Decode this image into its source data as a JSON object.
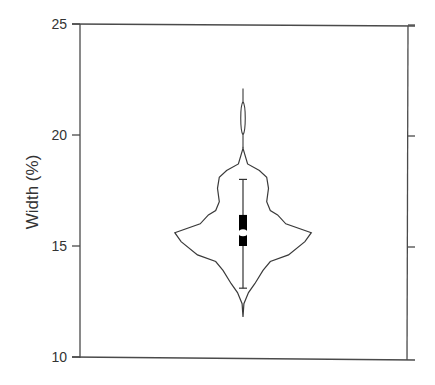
{
  "chart_data": {
    "type": "violin",
    "title": "",
    "xlabel": "",
    "ylabel": "Width (%)",
    "ylim": [
      10,
      25
    ],
    "yticks": [
      10,
      15,
      20,
      25
    ],
    "ytick_labels": [
      "10",
      "15",
      "20",
      "25"
    ],
    "right_axis_ticks": [
      15,
      20,
      25
    ],
    "grid": false,
    "legend": null,
    "series": [
      {
        "name": "Width",
        "box": {
          "whisker_low": 13.1,
          "q1": 15.0,
          "median": 15.6,
          "q3": 16.4,
          "whisker_high": 18.0
        },
        "violin_range": [
          11.8,
          22.1
        ],
        "density_profile": [
          {
            "y": 22.1,
            "half_width": 0.0
          },
          {
            "y": 21.4,
            "half_width": 0.01
          },
          {
            "y": 20.8,
            "half_width": 0.03
          },
          {
            "y": 20.2,
            "half_width": 0.01
          },
          {
            "y": 19.4,
            "half_width": 0.0
          },
          {
            "y": 18.7,
            "half_width": 0.05
          },
          {
            "y": 18.4,
            "half_width": 0.18
          },
          {
            "y": 18.1,
            "half_width": 0.26
          },
          {
            "y": 17.6,
            "half_width": 0.28
          },
          {
            "y": 17.0,
            "half_width": 0.26
          },
          {
            "y": 16.6,
            "half_width": 0.3
          },
          {
            "y": 16.4,
            "half_width": 0.38
          },
          {
            "y": 16.0,
            "half_width": 0.47
          },
          {
            "y": 15.6,
            "half_width": 0.75
          },
          {
            "y": 15.2,
            "half_width": 0.68
          },
          {
            "y": 14.6,
            "half_width": 0.5
          },
          {
            "y": 14.3,
            "half_width": 0.3
          },
          {
            "y": 13.9,
            "half_width": 0.22
          },
          {
            "y": 13.3,
            "half_width": 0.13
          },
          {
            "y": 12.9,
            "half_width": 0.06
          },
          {
            "y": 12.4,
            "half_width": 0.01
          },
          {
            "y": 11.8,
            "half_width": 0.0
          }
        ]
      }
    ]
  },
  "colors": {
    "axis": "#4a4a4a",
    "violin_outline": "#3a3a3a",
    "box_fill": "#000000",
    "background": "#ffffff"
  }
}
